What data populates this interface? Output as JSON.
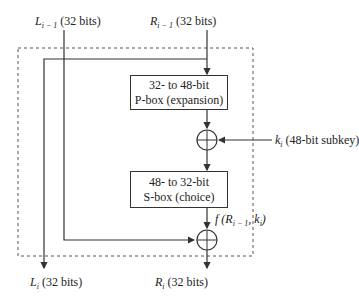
{
  "inputs": {
    "left": {
      "symbol": "L",
      "subscript": "i − 1",
      "bits": "(32 bits)"
    },
    "right": {
      "symbol": "R",
      "subscript": "i − 1",
      "bits": "(32 bits)"
    }
  },
  "outputs": {
    "left": {
      "symbol": "L",
      "subscript": "i",
      "bits": "(32 bits)"
    },
    "right": {
      "symbol": "R",
      "subscript": "i",
      "bits": "(32 bits)"
    }
  },
  "pbox": {
    "line1": "32- to 48-bit",
    "line2": "P-box (expansion)"
  },
  "sbox": {
    "line1": "48- to 32-bit",
    "line2": "S-box (choice)"
  },
  "subkey": {
    "symbol": "k",
    "subscript": "i",
    "text": "(48-bit subkey)"
  },
  "function_label": {
    "prefix": "f (R",
    "subscript": "i − 1",
    "middle": ", k",
    "subscript2": "i",
    "suffix": ")"
  },
  "colors": {
    "line": "#333333",
    "dashed": "#555555"
  }
}
